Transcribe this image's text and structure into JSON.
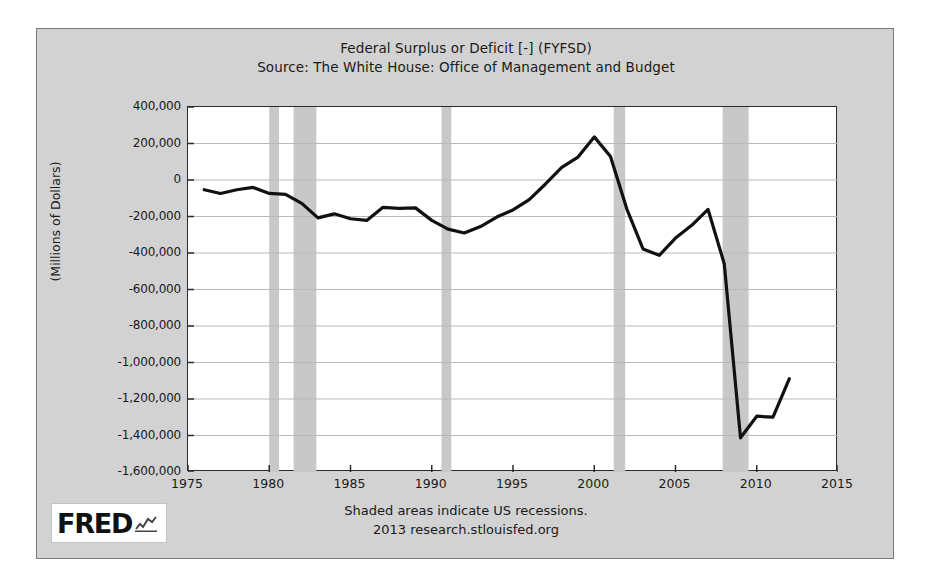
{
  "chart_data": {
    "type": "line",
    "title": "Federal Surplus or Deficit [-] (FYFSD)",
    "subtitle": "Source: The White House: Office of Management and Budget",
    "xlabel": "",
    "ylabel": "(Millions of Dollars)",
    "xlim": [
      1975,
      2015
    ],
    "ylim": [
      -1600000,
      400000
    ],
    "grid": true,
    "legend": false,
    "xticks": [
      1975,
      1980,
      1985,
      1990,
      1995,
      2000,
      2005,
      2010,
      2015
    ],
    "xtick_labels": [
      "1975",
      "1980",
      "1985",
      "1990",
      "1995",
      "2000",
      "2005",
      "2010",
      "2015"
    ],
    "yticks": [
      400000,
      200000,
      0,
      -200000,
      -400000,
      -600000,
      -800000,
      -1000000,
      -1200000,
      -1400000,
      -1600000
    ],
    "ytick_labels": [
      "400,000",
      "200,000",
      "0",
      "-200,000",
      "-400,000",
      "-600,000",
      "-800,000",
      "-1,000,000",
      "-1,200,000",
      "-1,400,000",
      "-1,600,000"
    ],
    "line_color": "#111111",
    "line_width": 3.2,
    "series": [
      {
        "name": "Federal Surplus or Deficit [-]",
        "x": [
          1976,
          1977,
          1978,
          1979,
          1980,
          1981,
          1982,
          1983,
          1984,
          1985,
          1986,
          1987,
          1988,
          1989,
          1990,
          1991,
          1992,
          1993,
          1994,
          1995,
          1996,
          1997,
          1998,
          1999,
          2000,
          2001,
          2002,
          2003,
          2004,
          2005,
          2006,
          2007,
          2008,
          2009,
          2010,
          2011,
          2012
        ],
        "values": [
          -53242,
          -73732,
          -53659,
          -40726,
          -73835,
          -78976,
          -127989,
          -207802,
          -185392,
          -212334,
          -221245,
          -149755,
          -155187,
          -152639,
          -221229,
          -269356,
          -290377,
          -255087,
          -203186,
          -163952,
          -107431,
          -21884,
          69270,
          125610,
          236241,
          128236,
          -157758,
          -377585,
          -412727,
          -318346,
          -248181,
          -160701,
          -458553,
          -1412688,
          -1294373,
          -1299595,
          -1089194
        ]
      }
    ],
    "recession_bands": [
      {
        "start": 1980.0,
        "end": 1980.6
      },
      {
        "start": 1981.5,
        "end": 1982.9
      },
      {
        "start": 1990.6,
        "end": 1991.2
      },
      {
        "start": 2001.2,
        "end": 2001.9
      },
      {
        "start": 2007.9,
        "end": 2009.5
      }
    ],
    "recession_color": "#c8c8c8"
  },
  "footer": {
    "recession_note": "Shaded areas indicate US recessions.",
    "source_note": "2013 research.stlouisfed.org",
    "logo_text": "FRED"
  }
}
